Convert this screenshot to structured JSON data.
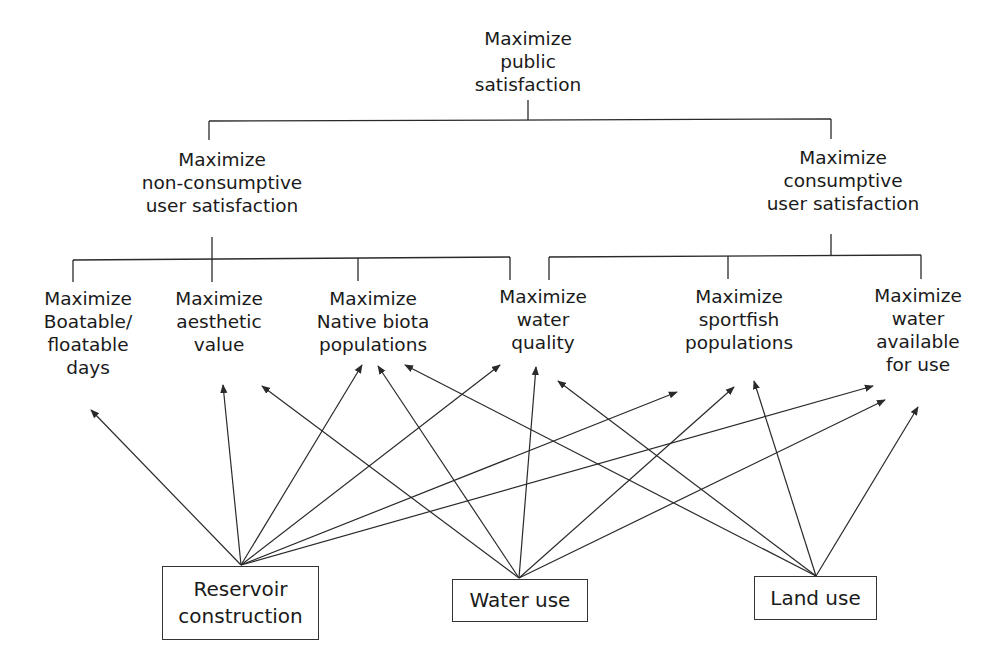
{
  "diagram": {
    "type": "objectives-hierarchy",
    "root": {
      "lines": [
        "Maximize",
        "public",
        "satisfaction"
      ]
    },
    "level2": [
      {
        "id": "nonconsumptive",
        "lines": [
          "Maximize",
          "non-consumptive",
          "user satisfaction"
        ]
      },
      {
        "id": "consumptive",
        "lines": [
          "Maximize",
          "consumptive",
          "user satisfaction"
        ]
      }
    ],
    "objectives": [
      {
        "id": "boatable",
        "parent": "nonconsumptive",
        "lines": [
          "Maximize",
          "Boatable/",
          "floatable",
          "days"
        ]
      },
      {
        "id": "aesthetic",
        "parent": "nonconsumptive",
        "lines": [
          "Maximize",
          "aesthetic",
          "value"
        ]
      },
      {
        "id": "native",
        "parent": "nonconsumptive",
        "lines": [
          "Maximize",
          "Native biota",
          "populations"
        ]
      },
      {
        "id": "quality",
        "parent": "both",
        "lines": [
          "Maximize",
          "water",
          "quality"
        ]
      },
      {
        "id": "sportfish",
        "parent": "consumptive",
        "lines": [
          "Maximize",
          "sportfish",
          "populations"
        ]
      },
      {
        "id": "available",
        "parent": "consumptive",
        "lines": [
          "Maximize",
          "water",
          "available",
          "for use"
        ]
      }
    ],
    "actions": [
      {
        "id": "reservoir",
        "lines": [
          "Reservoir",
          "construction"
        ]
      },
      {
        "id": "wateruse",
        "lines": [
          "Water use"
        ]
      },
      {
        "id": "landuse",
        "lines": [
          "Land use"
        ]
      }
    ],
    "influences": [
      {
        "from": "reservoir",
        "to": "boatable"
      },
      {
        "from": "reservoir",
        "to": "aesthetic"
      },
      {
        "from": "reservoir",
        "to": "native"
      },
      {
        "from": "reservoir",
        "to": "quality"
      },
      {
        "from": "reservoir",
        "to": "sportfish"
      },
      {
        "from": "reservoir",
        "to": "available"
      },
      {
        "from": "wateruse",
        "to": "aesthetic"
      },
      {
        "from": "wateruse",
        "to": "native"
      },
      {
        "from": "wateruse",
        "to": "quality"
      },
      {
        "from": "wateruse",
        "to": "sportfish"
      },
      {
        "from": "wateruse",
        "to": "available"
      },
      {
        "from": "landuse",
        "to": "native"
      },
      {
        "from": "landuse",
        "to": "quality"
      },
      {
        "from": "landuse",
        "to": "sportfish"
      },
      {
        "from": "landuse",
        "to": "available"
      }
    ],
    "colors": {
      "line": "#2a2a2a",
      "text": "#1a1a1a",
      "background": "#ffffff"
    }
  }
}
